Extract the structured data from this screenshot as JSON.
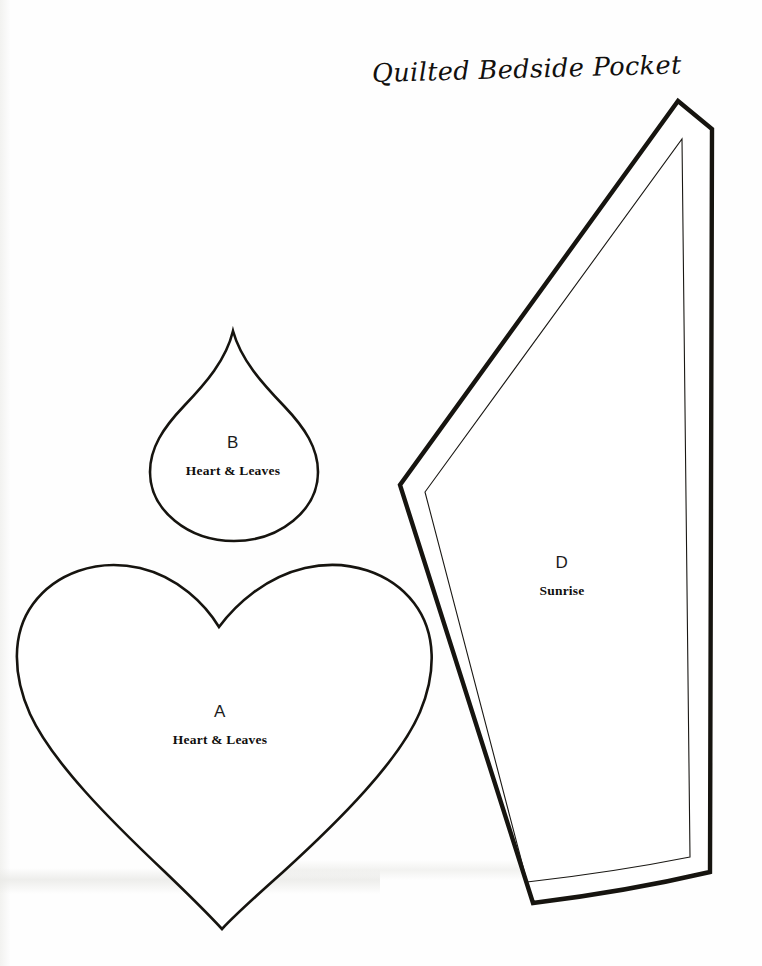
{
  "document": {
    "title": "Quilted Bedside Pocket",
    "type": "sewing pattern template sheet",
    "background_color": "#ffffff",
    "ink_color": "#16140f",
    "page_width": 762,
    "page_height": 966
  },
  "pieces": [
    {
      "id": "a",
      "letter": "A",
      "name": "Heart & Leaves",
      "shape": "heart",
      "label_position": {
        "x": 220,
        "y": 712
      }
    },
    {
      "id": "b",
      "letter": "B",
      "name": "Heart & Leaves",
      "shape": "teardrop",
      "label_position": {
        "x": 233,
        "y": 443
      }
    },
    {
      "id": "d",
      "letter": "D",
      "name": "Sunrise",
      "shape": "tapered-wedge-with-seam-allowance",
      "label_position": {
        "x": 562,
        "y": 563
      }
    }
  ]
}
